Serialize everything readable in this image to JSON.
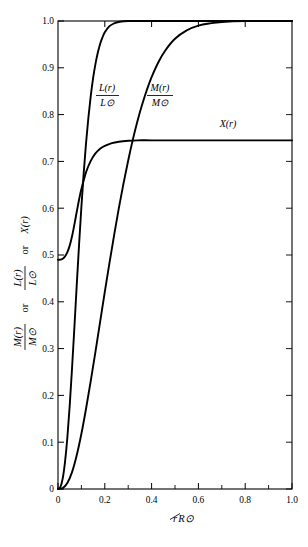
{
  "figure": {
    "background_color": "#ffffff",
    "ink_color": "#000000"
  },
  "chart_data": {
    "type": "line",
    "title": "",
    "subtitle": "",
    "xlabel": "r/R⊙",
    "ylabel": "M(r)/M⊙ or L(r)/L⊙ or X(r)",
    "xlim": [
      0,
      1.0
    ],
    "ylim": [
      0,
      1.0
    ],
    "grid": false,
    "legend_position": "inline-annotations",
    "xticks": [
      0,
      0.2,
      0.4,
      0.6,
      0.8,
      1.0
    ],
    "xticklabels": [
      "0",
      "0.2",
      "0.4",
      "0.6",
      "0.8",
      "1.0"
    ],
    "xminorticks": [
      0.1,
      0.3,
      0.5,
      0.7,
      0.9
    ],
    "yticks": [
      0,
      0.1,
      0.2,
      0.3,
      0.4,
      0.5,
      0.6,
      0.7,
      0.8,
      0.9,
      1.0
    ],
    "yticklabels": [
      "0",
      "0.1",
      "0.2",
      "0.3",
      "0.4",
      "0.5",
      "0.6",
      "0.7",
      "0.8",
      "0.9",
      "1.0"
    ],
    "tick_direction": "in",
    "frame": "all-four-sides",
    "series": [
      {
        "name": "L(r)/L⊙",
        "label_numerator": "L(r)",
        "label_denominator": "L⊙",
        "x": [
          0.0,
          0.01,
          0.02,
          0.03,
          0.04,
          0.05,
          0.06,
          0.07,
          0.08,
          0.09,
          0.1,
          0.11,
          0.12,
          0.13,
          0.14,
          0.15,
          0.16,
          0.17,
          0.18,
          0.19,
          0.2,
          0.22,
          0.24,
          0.26,
          0.3,
          0.4,
          0.6,
          0.8,
          1.0
        ],
        "values": [
          0.0,
          0.004,
          0.022,
          0.058,
          0.11,
          0.178,
          0.258,
          0.345,
          0.435,
          0.522,
          0.603,
          0.676,
          0.74,
          0.794,
          0.84,
          0.878,
          0.908,
          0.932,
          0.951,
          0.965,
          0.976,
          0.989,
          0.995,
          0.998,
          1.0,
          1.0,
          1.0,
          1.0,
          1.0
        ]
      },
      {
        "name": "M(r)/M⊙",
        "label_numerator": "M(r)",
        "label_denominator": "M⊙",
        "x": [
          0.0,
          0.02,
          0.04,
          0.06,
          0.08,
          0.1,
          0.12,
          0.14,
          0.16,
          0.18,
          0.2,
          0.22,
          0.24,
          0.26,
          0.28,
          0.3,
          0.32,
          0.34,
          0.36,
          0.38,
          0.4,
          0.43,
          0.46,
          0.5,
          0.55,
          0.6,
          0.65,
          0.7,
          0.8,
          0.9,
          1.0
        ],
        "values": [
          0.0,
          0.002,
          0.013,
          0.036,
          0.072,
          0.118,
          0.172,
          0.231,
          0.293,
          0.357,
          0.421,
          0.483,
          0.543,
          0.6,
          0.653,
          0.702,
          0.747,
          0.787,
          0.822,
          0.853,
          0.88,
          0.913,
          0.938,
          0.962,
          0.98,
          0.99,
          0.995,
          0.998,
          1.0,
          1.0,
          1.0
        ]
      },
      {
        "name": "X(r)",
        "label_numerator": "X(r)",
        "label_denominator": "",
        "x": [
          0.0,
          0.01,
          0.02,
          0.03,
          0.04,
          0.05,
          0.06,
          0.07,
          0.08,
          0.09,
          0.1,
          0.12,
          0.14,
          0.16,
          0.18,
          0.2,
          0.23,
          0.26,
          0.3,
          0.34,
          0.4,
          0.5,
          0.6,
          0.7,
          0.8,
          0.9,
          1.0
        ],
        "values": [
          0.49,
          0.49,
          0.492,
          0.497,
          0.506,
          0.52,
          0.54,
          0.565,
          0.592,
          0.618,
          0.641,
          0.677,
          0.701,
          0.717,
          0.727,
          0.733,
          0.739,
          0.742,
          0.744,
          0.745,
          0.745,
          0.745,
          0.745,
          0.745,
          0.745,
          0.745,
          0.745
        ]
      }
    ],
    "annotations": [
      {
        "text": "L(r)/L⊙",
        "x": 0.175,
        "y": 0.845
      },
      {
        "text": "M(r)/M⊙",
        "x": 0.395,
        "y": 0.845
      },
      {
        "text": "X(r)",
        "x": 0.735,
        "y": 0.775
      }
    ]
  },
  "labels": {
    "x_axis": {
      "numerator": "r",
      "denominator": "R⊙",
      "full": "r/R⊙"
    },
    "y_axis": {
      "part1_num": "M(r)",
      "part1_den": "M⊙",
      "conj1": "or",
      "part2_num": "L(r)",
      "part2_den": "L⊙",
      "conj2": "or",
      "part3": "X(r)",
      "full": "M(r)/M⊙ or L(r)/L⊙ or X(r)"
    },
    "curve_L": {
      "num": "L(r)",
      "den": "L⊙"
    },
    "curve_M": {
      "num": "M(r)",
      "den": "M⊙"
    },
    "curve_X": {
      "text": "X(r)"
    }
  },
  "ticks": {
    "x": [
      "0",
      "0.2",
      "0.4",
      "0.6",
      "0.8",
      "1.0"
    ],
    "y": [
      "1.0",
      "0.9",
      "0.8",
      "0.7",
      "0.6",
      "0.5",
      "0.4",
      "0.3",
      "0.2",
      "0.1",
      "0"
    ]
  }
}
